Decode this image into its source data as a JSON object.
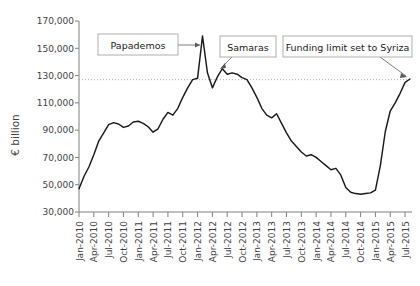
{
  "chart_data": {
    "type": "line",
    "title": "",
    "xlabel": "",
    "ylabel": "€ billion",
    "ylim": [
      30000,
      170000
    ],
    "ytick_values": [
      30000,
      50000,
      70000,
      90000,
      110000,
      130000,
      150000,
      170000
    ],
    "ytick_labels": [
      "30,000",
      "50,000",
      "70,000",
      "90,000",
      "110,000",
      "130,000",
      "150,000",
      "170,000"
    ],
    "grid": false,
    "legend": "none",
    "reference_line": {
      "value": 127000,
      "style": "dotted",
      "label": ""
    },
    "xtick_labels": [
      "Jan-2010",
      "Apr-2010",
      "Jul-2010",
      "Oct-2010",
      "Jan-2011",
      "Apr-2011",
      "Jul-2011",
      "Oct-2011",
      "Jan-2012",
      "Apr-2012",
      "Jul-2012",
      "Oct-2012",
      "Jan-2013",
      "Apr-2013",
      "Jul-2013",
      "Oct-2013",
      "Jan-2014",
      "Apr-2014",
      "Jul-2014",
      "Oct-2014",
      "Jan-2015",
      "Apr-2015",
      "Jul-2015"
    ],
    "x": [
      "Jan-2010",
      "Feb-2010",
      "Mar-2010",
      "Apr-2010",
      "May-2010",
      "Jun-2010",
      "Jul-2010",
      "Aug-2010",
      "Sep-2010",
      "Oct-2010",
      "Nov-2010",
      "Dec-2010",
      "Jan-2011",
      "Feb-2011",
      "Mar-2011",
      "Apr-2011",
      "May-2011",
      "Jun-2011",
      "Jul-2011",
      "Aug-2011",
      "Sep-2011",
      "Oct-2011",
      "Nov-2011",
      "Dec-2011",
      "Jan-2012",
      "Feb-2012",
      "Mar-2012",
      "Apr-2012",
      "May-2012",
      "Jun-2012",
      "Jul-2012",
      "Aug-2012",
      "Sep-2012",
      "Oct-2012",
      "Nov-2012",
      "Dec-2012",
      "Jan-2013",
      "Feb-2013",
      "Mar-2013",
      "Apr-2013",
      "May-2013",
      "Jun-2013",
      "Jul-2013",
      "Aug-2013",
      "Sep-2013",
      "Oct-2013",
      "Nov-2013",
      "Dec-2013",
      "Jan-2014",
      "Feb-2014",
      "Mar-2014",
      "Apr-2014",
      "May-2014",
      "Jun-2014",
      "Jul-2014",
      "Aug-2014",
      "Sep-2014",
      "Oct-2014",
      "Nov-2014",
      "Dec-2014",
      "Jan-2015",
      "Feb-2015",
      "Mar-2015",
      "Apr-2015",
      "May-2015",
      "Jun-2015",
      "Jul-2015",
      "Aug-2015"
    ],
    "series": [
      {
        "name": "Eurosystem funding to Greek banks",
        "values": [
          47000,
          56000,
          63000,
          72000,
          82000,
          88000,
          94000,
          95500,
          94500,
          92000,
          93000,
          96000,
          96500,
          95000,
          92500,
          88500,
          91000,
          98000,
          103000,
          101000,
          106000,
          114000,
          121000,
          127000,
          128000,
          159000,
          132000,
          121000,
          129000,
          135000,
          131000,
          132000,
          131000,
          128500,
          127000,
          121000,
          114000,
          106000,
          101000,
          99000,
          102000,
          95000,
          88000,
          82000,
          78000,
          74000,
          71000,
          72000,
          70000,
          67000,
          64000,
          61000,
          62000,
          57000,
          48000,
          44500,
          43500,
          43000,
          43500,
          44000,
          46000,
          64000,
          89000,
          104000,
          110000,
          117000,
          125000,
          127500
        ]
      }
    ],
    "annotations": [
      {
        "name": "papademos",
        "text": "Papademos",
        "points_to": "Feb-2012"
      },
      {
        "name": "samaras",
        "text": "Samaras",
        "points_to": "Jun-2012"
      },
      {
        "name": "funding-limit",
        "text": "Funding limit set to Syriza",
        "points_to": "Aug-2015"
      }
    ]
  },
  "colors": {
    "line": "#1a1a1a",
    "axis": "#808080",
    "text": "#3f3f3f",
    "callout_border": "#a6a6a6",
    "background": "#ffffff"
  }
}
